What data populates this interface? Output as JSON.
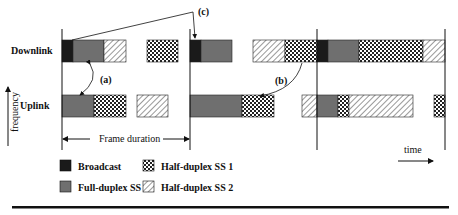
{
  "figure": {
    "row_labels": {
      "downlink": "Downlink",
      "uplink": "Uplink"
    },
    "axis_labels": {
      "frequency": "frequency",
      "time": "time"
    },
    "annotations": {
      "a": "(a)",
      "b": "(b)",
      "c": "(c)"
    },
    "frame_duration_label": "Frame duration",
    "colors": {
      "broadcast": "#1a1a1a",
      "full_duplex": "#6f6f6f",
      "line": "#111111"
    }
  },
  "legend": {
    "items": [
      {
        "key": "broadcast",
        "label": "Broadcast"
      },
      {
        "key": "half1",
        "label": "Half-duplex SS 1"
      },
      {
        "key": "full",
        "label": "Full-duplex SS"
      },
      {
        "key": "half2",
        "label": "Half-duplex SS 2"
      }
    ]
  },
  "timeline": {
    "frame_boundaries_x": [
      62,
      190,
      317,
      445
    ],
    "downlink_blocks": [
      {
        "type": "broadcast",
        "x": 62,
        "w": 11
      },
      {
        "type": "full",
        "x": 73,
        "w": 31
      },
      {
        "type": "half2",
        "x": 104,
        "w": 22
      },
      {
        "type": "half1",
        "x": 147,
        "w": 31
      },
      {
        "type": "broadcast",
        "x": 190,
        "w": 11
      },
      {
        "type": "full",
        "x": 201,
        "w": 31
      },
      {
        "type": "half2",
        "x": 253,
        "w": 32
      },
      {
        "type": "half1",
        "x": 285,
        "w": 32
      },
      {
        "type": "broadcast",
        "x": 317,
        "w": 11
      },
      {
        "type": "full",
        "x": 328,
        "w": 31
      },
      {
        "type": "half1",
        "x": 359,
        "w": 64
      },
      {
        "type": "half2",
        "x": 423,
        "w": 22
      }
    ],
    "uplink_blocks": [
      {
        "type": "full",
        "x": 62,
        "w": 32
      },
      {
        "type": "half1",
        "x": 94,
        "w": 32
      },
      {
        "type": "half2",
        "x": 137,
        "w": 31
      },
      {
        "type": "full",
        "x": 190,
        "w": 52
      },
      {
        "type": "half1",
        "x": 242,
        "w": 32
      },
      {
        "type": "half2",
        "x": 302,
        "w": 15
      },
      {
        "type": "full",
        "x": 317,
        "w": 21
      },
      {
        "type": "half1",
        "x": 338,
        "w": 11
      },
      {
        "type": "half2",
        "x": 349,
        "w": 64
      },
      {
        "type": "half1",
        "x": 434,
        "w": 11
      }
    ]
  }
}
